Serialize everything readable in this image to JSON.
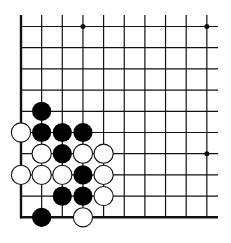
{
  "diagram": {
    "type": "go-board-fragment",
    "corner": "bottom-left",
    "columns": 10,
    "rows": 10,
    "colors": {
      "line": "#111111",
      "black_stone": "#000000",
      "white_stone": "#ffffff",
      "background": "#ffffff"
    },
    "star_points": [
      {
        "col": 3,
        "row": 0
      },
      {
        "col": 9,
        "row": 0
      },
      {
        "col": 9,
        "row": 6
      }
    ],
    "stones": [
      {
        "color": "black",
        "col": 1,
        "row": 4
      },
      {
        "color": "white",
        "col": 0,
        "row": 5
      },
      {
        "color": "black",
        "col": 1,
        "row": 5
      },
      {
        "color": "black",
        "col": 2,
        "row": 5
      },
      {
        "color": "black",
        "col": 3,
        "row": 5
      },
      {
        "color": "white",
        "col": 1,
        "row": 6
      },
      {
        "color": "black",
        "col": 2,
        "row": 6
      },
      {
        "color": "white",
        "col": 3,
        "row": 6
      },
      {
        "color": "white",
        "col": 4,
        "row": 6
      },
      {
        "color": "white",
        "col": 0,
        "row": 7
      },
      {
        "color": "white",
        "col": 1,
        "row": 7
      },
      {
        "color": "white",
        "col": 2,
        "row": 7
      },
      {
        "color": "black",
        "col": 3,
        "row": 7
      },
      {
        "color": "white",
        "col": 4,
        "row": 7
      },
      {
        "color": "black",
        "col": 2,
        "row": 8
      },
      {
        "color": "black",
        "col": 3,
        "row": 8
      },
      {
        "color": "white",
        "col": 4,
        "row": 8
      },
      {
        "color": "black",
        "col": 1,
        "row": 9
      },
      {
        "color": "white",
        "col": 3,
        "row": 9
      }
    ]
  }
}
